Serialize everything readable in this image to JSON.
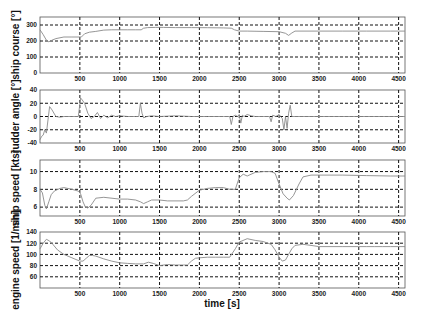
{
  "figure": {
    "xlabel": "time [s]",
    "x_ticks": [
      500,
      1000,
      1500,
      2000,
      2500,
      3000,
      3500,
      4000,
      4500
    ],
    "xlim": [
      0,
      4580
    ]
  },
  "chart_data": [
    {
      "type": "line",
      "title": "",
      "xlabel": "",
      "ylabel": "ship course [°]",
      "ylim": [
        0,
        350
      ],
      "yticks": [
        0,
        100,
        200,
        300
      ],
      "grid": true,
      "grid_y": [
        100,
        200,
        300
      ],
      "x_ticks": [
        500,
        1000,
        1500,
        2000,
        2500,
        3000,
        3500,
        4000,
        4500
      ],
      "series": [
        {
          "name": "ship course",
          "x": [
            0,
            40,
            80,
            110,
            150,
            200,
            300,
            400,
            500,
            520,
            560,
            620,
            700,
            800,
            900,
            1000,
            1100,
            1200,
            1270,
            1300,
            1350,
            1450,
            1550,
            1700,
            1900,
            2100,
            2300,
            2400,
            2440,
            2500,
            2600,
            2800,
            3000,
            3080,
            3120,
            3160,
            3200,
            3300,
            3500,
            3800,
            4100,
            4400,
            4580
          ],
          "y": [
            270,
            240,
            205,
            195,
            205,
            215,
            225,
            225,
            225,
            225,
            245,
            255,
            260,
            268,
            270,
            270,
            270,
            270,
            270,
            280,
            284,
            285,
            285,
            284,
            284,
            283,
            282,
            280,
            270,
            262,
            262,
            260,
            258,
            248,
            235,
            250,
            262,
            262,
            262,
            262,
            262,
            262,
            262
          ]
        }
      ]
    },
    {
      "type": "line",
      "title": "",
      "xlabel": "",
      "ylabel": "rudder angle [°]",
      "ylim": [
        -40,
        40
      ],
      "yticks": [
        -40,
        -20,
        0,
        20,
        40
      ],
      "grid": true,
      "grid_y": [
        -20,
        0,
        20
      ],
      "x_ticks": [
        500,
        1000,
        1500,
        2000,
        2500,
        3000,
        3500,
        4000,
        4500
      ],
      "series": [
        {
          "name": "rudder angle",
          "x": [
            0,
            20,
            40,
            60,
            80,
            100,
            120,
            150,
            200,
            250,
            300,
            400,
            480,
            510,
            530,
            560,
            600,
            640,
            680,
            720,
            760,
            800,
            850,
            900,
            950,
            1000,
            1100,
            1200,
            1240,
            1260,
            1280,
            1300,
            1340,
            1400,
            1500,
            1700,
            1900,
            2100,
            2300,
            2380,
            2400,
            2420,
            2450,
            2480,
            2500,
            2520,
            2540,
            2560,
            2600,
            2650,
            2700,
            2800,
            2880,
            2900,
            2920,
            2960,
            3000,
            3020,
            3040,
            3060,
            3080,
            3100,
            3120,
            3140,
            3160,
            3200,
            3300,
            3500,
            4000,
            4580
          ],
          "y": [
            -35,
            -30,
            -28,
            -20,
            -25,
            -5,
            15,
            10,
            0,
            -1,
            0,
            0,
            0,
            28,
            25,
            20,
            5,
            -3,
            0,
            6,
            -3,
            2,
            -2,
            2,
            0,
            1,
            0,
            0,
            0,
            20,
            5,
            -2,
            0,
            1,
            0,
            1,
            0,
            0,
            0,
            0,
            -12,
            0,
            2,
            0,
            3,
            -10,
            2,
            0,
            3,
            1,
            0,
            0,
            0,
            -8,
            2,
            0,
            3,
            0,
            -3,
            -20,
            0,
            -18,
            5,
            17,
            0,
            0,
            0,
            0,
            0,
            0
          ]
        }
      ]
    },
    {
      "type": "line",
      "title": "",
      "xlabel": "",
      "ylabel": "ship speed [kts]",
      "ylim": [
        5,
        11.3
      ],
      "yticks": [
        6,
        8,
        10
      ],
      "grid": true,
      "grid_y": [
        6,
        8,
        10
      ],
      "x_ticks": [
        500,
        1000,
        1500,
        2000,
        2500,
        3000,
        3500,
        4000,
        4500
      ],
      "series": [
        {
          "name": "ship speed",
          "x": [
            0,
            30,
            60,
            80,
            110,
            140,
            180,
            250,
            300,
            400,
            480,
            510,
            540,
            570,
            600,
            640,
            700,
            800,
            1000,
            1100,
            1200,
            1260,
            1300,
            1350,
            1400,
            1500,
            1600,
            1800,
            1850,
            1900,
            2000,
            2100,
            2200,
            2300,
            2380,
            2400,
            2450,
            2500,
            2550,
            2600,
            2700,
            2800,
            2900,
            2950,
            3000,
            3050,
            3100,
            3130,
            3180,
            3250,
            3300,
            3400,
            3500,
            3800,
            4100,
            4400,
            4580
          ],
          "y": [
            8,
            7.6,
            6.2,
            5.8,
            6.6,
            7.4,
            7.8,
            8.1,
            8.2,
            8.0,
            7.8,
            7.5,
            6.6,
            6.0,
            5.9,
            6.2,
            7.0,
            7.1,
            6.9,
            6.9,
            6.8,
            6.6,
            6.4,
            6.6,
            6.8,
            6.8,
            6.7,
            6.7,
            6.8,
            7.2,
            7.9,
            8.1,
            8.2,
            8.2,
            8.0,
            8.0,
            8.0,
            9.3,
            9.7,
            9.5,
            9.9,
            10.0,
            10.0,
            9.8,
            8.6,
            7.5,
            7.0,
            6.8,
            7.3,
            8.6,
            9.4,
            9.6,
            9.6,
            9.6,
            9.55,
            9.5,
            9.5
          ]
        }
      ]
    },
    {
      "type": "line",
      "title": "",
      "xlabel": "time [s]",
      "ylabel": "engine speed [1/min]",
      "ylim": [
        40,
        140
      ],
      "yticks": [
        60,
        80,
        100,
        120,
        140
      ],
      "grid": true,
      "grid_y": [
        60,
        80,
        100,
        120
      ],
      "x_ticks": [
        500,
        1000,
        1500,
        2000,
        2500,
        3000,
        3500,
        4000,
        4500
      ],
      "series": [
        {
          "name": "engine speed",
          "x": [
            0,
            40,
            80,
            120,
            160,
            220,
            300,
            400,
            500,
            540,
            580,
            620,
            660,
            700,
            800,
            900,
            1000,
            1100,
            1200,
            1300,
            1360,
            1420,
            1500,
            1600,
            1700,
            1800,
            1850,
            1900,
            1950,
            2000,
            2100,
            2200,
            2300,
            2380,
            2450,
            2500,
            2600,
            2700,
            2800,
            2900,
            2950,
            3000,
            3040,
            3080,
            3120,
            3160,
            3200,
            3300,
            3400,
            3500,
            3800,
            4000,
            4100,
            4200,
            4300,
            4400,
            4580
          ],
          "y": [
            110,
            120,
            127,
            124,
            118,
            108,
            100,
            94,
            88,
            88,
            93,
            98,
            98,
            97,
            92,
            88,
            85,
            84,
            83,
            83,
            86,
            84,
            80,
            82,
            81,
            81,
            81,
            88,
            93,
            94,
            95,
            95,
            95,
            95,
            110,
            122,
            128,
            125,
            123,
            118,
            108,
            95,
            88,
            90,
            100,
            110,
            116,
            118,
            116,
            114,
            114,
            114,
            114,
            114,
            114,
            114,
            114
          ]
        }
      ]
    }
  ]
}
